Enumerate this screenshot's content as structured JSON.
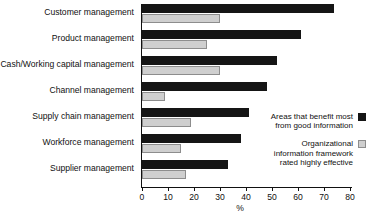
{
  "chart_data": {
    "type": "bar",
    "orientation": "horizontal",
    "title": "",
    "xlabel": "%",
    "ylabel": "",
    "xlim": [
      0,
      80
    ],
    "xticks": [
      0,
      10,
      20,
      30,
      40,
      50,
      60,
      70,
      80
    ],
    "xticklabels": [
      "0",
      "10",
      "20",
      "30",
      "40",
      "50",
      "60",
      "70",
      "80"
    ],
    "grid": false,
    "legend_position": "right",
    "categories": [
      "Customer management",
      "Product management",
      "Cash/Working capital management",
      "Channel management",
      "Supply chain management",
      "Workforce management",
      "Supplier management"
    ],
    "series": [
      {
        "name": "Areas that benefit most from good information",
        "color": "#151515",
        "values": [
          74,
          61,
          52,
          48,
          41,
          38,
          33
        ]
      },
      {
        "name": "Organizational information framework rated highly effective",
        "color": "#cfcfcf",
        "values": [
          30,
          25,
          30,
          9,
          19,
          15,
          17
        ]
      }
    ]
  },
  "legend": [
    {
      "label": "Areas that benefit most\nfrom good information",
      "swatch": "dark"
    },
    {
      "label": "Organizational\ninformation framework\nrated highly effective",
      "swatch": "light"
    }
  ]
}
